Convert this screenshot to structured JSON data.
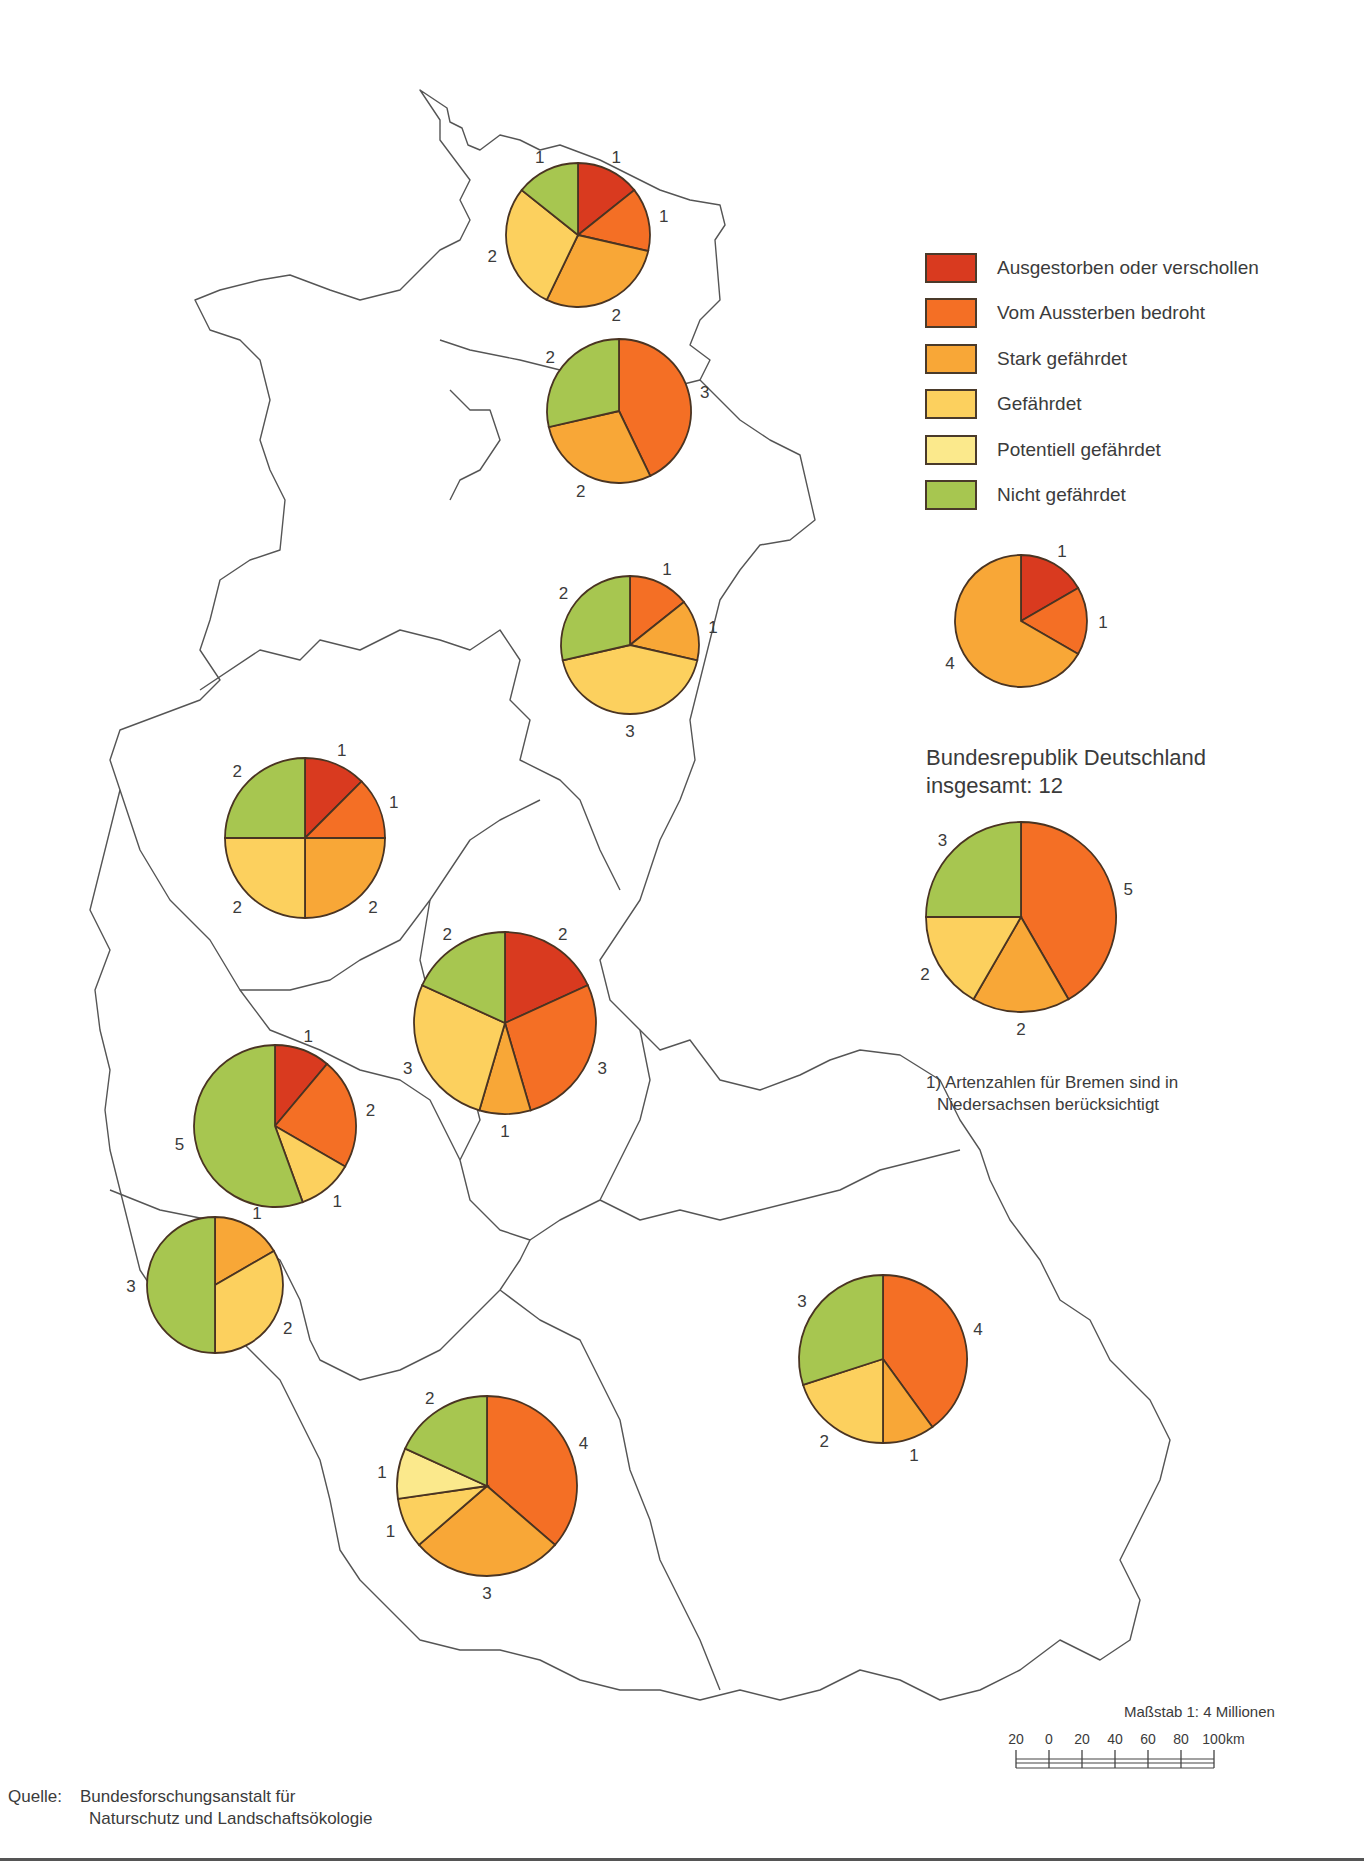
{
  "legend": {
    "items": [
      {
        "key": "extinct",
        "label": "Ausgestorben oder verschollen",
        "color": "#d93a1f"
      },
      {
        "key": "critical",
        "label": "Vom Aussterben bedroht",
        "color": "#f46f25"
      },
      {
        "key": "strong",
        "label": "Stark gefährdet",
        "color": "#f8a737"
      },
      {
        "key": "endangered",
        "label": "Gefährdet",
        "color": "#fcd05e"
      },
      {
        "key": "potential",
        "label": "Potentiell gefährdet",
        "color": "#fbe98c"
      },
      {
        "key": "not",
        "label": "Nicht gefährdet",
        "color": "#a7c650"
      }
    ]
  },
  "national": {
    "title_line1": "Bundesrepublik Deutschland",
    "title_line2": "insgesamt: 12"
  },
  "footnote": {
    "line1": "1) Artenzahlen für Bremen sind in",
    "line2": "Niedersachsen berücksichtigt"
  },
  "scale": {
    "title": "Maßstab 1: 4 Millionen",
    "ticks": [
      "20",
      "0",
      "20",
      "40",
      "60",
      "80",
      "100"
    ],
    "unit": "km"
  },
  "source": {
    "label": "Quelle:",
    "line1": "Bundesforschungsanstalt für",
    "line2": "Naturschutz und Landschaftsökologie"
  },
  "chart_data": {
    "type": "pie",
    "title": "Bundesrepublik Deutschland insgesamt: 12",
    "categories": [
      "Ausgestorben oder verschollen",
      "Vom Aussterben bedroht",
      "Stark gefährdet",
      "Gefährdet",
      "Potentiell gefährdet",
      "Nicht gefährdet"
    ],
    "colors": [
      "#d93a1f",
      "#f46f25",
      "#f8a737",
      "#fcd05e",
      "#fbe98c",
      "#a7c650"
    ],
    "pies": [
      {
        "region": "north-1",
        "cx": 578,
        "cy": 235,
        "r": 72,
        "values": [
          1,
          1,
          2,
          2,
          0,
          1
        ]
      },
      {
        "region": "north-2",
        "cx": 619,
        "cy": 411,
        "r": 72,
        "values": [
          0,
          3,
          2,
          0,
          0,
          2
        ]
      },
      {
        "region": "north-3",
        "cx": 630,
        "cy": 645,
        "r": 69,
        "values": [
          0,
          1,
          1,
          3,
          0,
          2
        ]
      },
      {
        "region": "east-inset",
        "cx": 1021,
        "cy": 621,
        "r": 66,
        "values": [
          1,
          1,
          4,
          0,
          0,
          0
        ]
      },
      {
        "region": "west",
        "cx": 305,
        "cy": 838,
        "r": 80,
        "values": [
          1,
          1,
          2,
          2,
          0,
          2
        ]
      },
      {
        "region": "center",
        "cx": 505,
        "cy": 1023,
        "r": 91,
        "values": [
          2,
          3,
          1,
          3,
          0,
          2
        ]
      },
      {
        "region": "southwest-1",
        "cx": 275,
        "cy": 1126,
        "r": 81,
        "values": [
          1,
          2,
          0,
          1,
          0,
          5
        ]
      },
      {
        "region": "southwest-2",
        "cx": 215,
        "cy": 1285,
        "r": 68,
        "values": [
          0,
          0,
          1,
          2,
          0,
          3
        ]
      },
      {
        "region": "southeast",
        "cx": 883,
        "cy": 1359,
        "r": 84,
        "values": [
          0,
          4,
          1,
          2,
          0,
          3
        ]
      },
      {
        "region": "south",
        "cx": 487,
        "cy": 1486,
        "r": 90,
        "values": [
          0,
          4,
          3,
          1,
          1,
          2
        ]
      },
      {
        "region": "national-total",
        "cx": 1021,
        "cy": 917,
        "r": 95,
        "values": [
          0,
          5,
          2,
          2,
          0,
          3
        ],
        "total": 12
      }
    ]
  }
}
